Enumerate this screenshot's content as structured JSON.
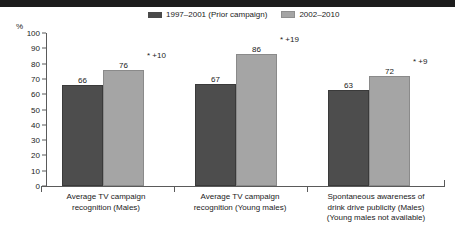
{
  "header": {
    "band_title": "",
    "band_color": "#1c1c1c"
  },
  "axis": {
    "unit_label": "%",
    "yticks": [
      "100",
      "90",
      "80",
      "70",
      "60",
      "50",
      "40",
      "30",
      "20",
      "10",
      "0"
    ]
  },
  "legend": [
    {
      "label": "1997–2001 (Prior campaign)",
      "color": "#4a4a4a",
      "swatch": "dark"
    },
    {
      "label": "2002–2010",
      "color": "#a5a5a5",
      "swatch": "light"
    }
  ],
  "groups": [
    {
      "label_lines": [
        "Average TV campaign",
        "recognition (Males)"
      ],
      "prior_value": "66",
      "current_value": "76",
      "annotation": "*  +10"
    },
    {
      "label_lines": [
        "Average TV campaign",
        "recognition (Young males)"
      ],
      "prior_value": "67",
      "current_value": "86",
      "annotation": "*  +19"
    },
    {
      "label_lines": [
        "Spontaneous awareness of",
        "drink drive publicity (Males)",
        "(Young males not available)"
      ],
      "prior_value": "63",
      "current_value": "72",
      "annotation": "*  +9"
    }
  ],
  "chart_data": {
    "type": "bar",
    "title": "",
    "xlabel": "",
    "ylabel": "%",
    "ylim": [
      0,
      100
    ],
    "ytick_step": 10,
    "grid": false,
    "legend_position": "top-center",
    "categories": [
      "Average TV campaign recognition (Males)",
      "Average TV campaign recognition (Young males)",
      "Spontaneous awareness of drink drive publicity (Males) (Young males not available)"
    ],
    "series": [
      {
        "name": "1997–2001 (Prior campaign)",
        "values": [
          66,
          67,
          63
        ],
        "color": "#4a4a4a"
      },
      {
        "name": "2002–2010",
        "values": [
          76,
          86,
          72
        ],
        "color": "#a5a5a5"
      }
    ],
    "annotations": [
      "*  +10",
      "*  +19",
      "*  +9"
    ]
  }
}
